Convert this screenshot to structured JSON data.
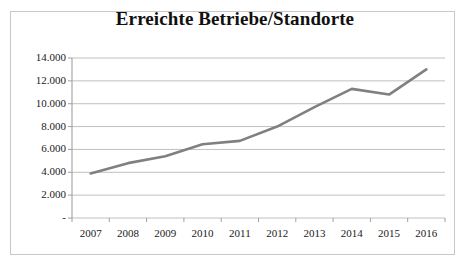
{
  "figure": {
    "background_color": "#ffffff",
    "border_color": "#c8c8c8"
  },
  "chart_data": {
    "type": "line",
    "title": "Erreichte Betriebe/Standorte",
    "xlabel": "",
    "ylabel": "",
    "categories": [
      "2007",
      "2008",
      "2009",
      "2010",
      "2011",
      "2012",
      "2013",
      "2014",
      "2015",
      "2016"
    ],
    "values": [
      3900,
      4800,
      5400,
      6450,
      6750,
      8000,
      9700,
      11300,
      10800,
      13000
    ],
    "series": [
      {
        "name": "Erreichte Betriebe/Standorte",
        "values": [
          3900,
          4800,
          5400,
          6450,
          6750,
          8000,
          9700,
          11300,
          10800,
          13000
        ],
        "color": "#808080"
      }
    ],
    "ylim": [
      0,
      14000
    ],
    "ytick_values": [
      0,
      2000,
      4000,
      6000,
      8000,
      10000,
      12000,
      14000
    ],
    "ytick_labels": [
      "-",
      "2.000",
      "4.000",
      "6.000",
      "8.000",
      "10.000",
      "12.000",
      "14.000"
    ],
    "xtick_labels": [
      "2007",
      "2008",
      "2009",
      "2010",
      "2011",
      "2012",
      "2013",
      "2014",
      "2015",
      "2016"
    ],
    "grid": true,
    "grid_axis": "y",
    "grid_color": "#c0c0c0",
    "legend": false,
    "legend_position": "none",
    "line_color": "#808080",
    "line_width": 2.6,
    "markers": false,
    "axis_color": "#a0a0a0"
  }
}
